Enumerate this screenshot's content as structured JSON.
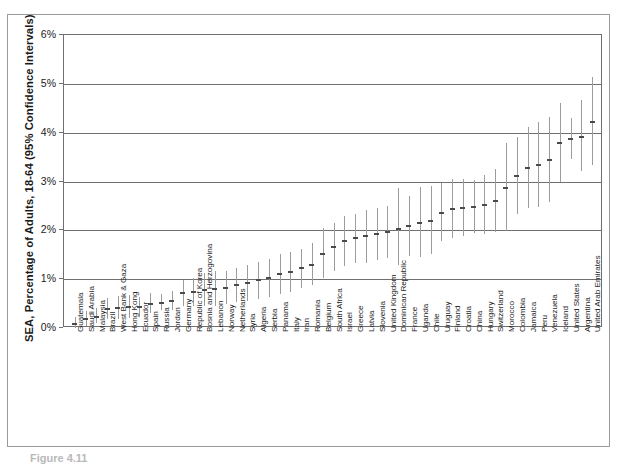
{
  "figure": {
    "caption": "Figure 4.11",
    "y_axis_title": "SEA, Percentage of Adults, 18-64 (95% Confidence Intervals)"
  },
  "chart_data": {
    "type": "scatter",
    "title": "",
    "subtitle": "",
    "xlabel": "",
    "ylabel": "SEA, Percentage of Adults, 18-64 (95% Confidence Intervals)",
    "ylim": [
      0,
      6
    ],
    "y_unit": "percent",
    "y_tick_labels": [
      "0%",
      "1%",
      "2%",
      "3%",
      "4%",
      "5%",
      "6%"
    ],
    "y_ticks": [
      0,
      1,
      2,
      3,
      4,
      5,
      6
    ],
    "grid": "horizontal",
    "legend": "none",
    "error_bars": "95% confidence intervals",
    "marker": "point estimate with vertical CI whisker",
    "sort_order": "ascending by point estimate",
    "n_categories": 63,
    "categories": [
      "Guatemala",
      "Saudi Arabia",
      "Malaysia",
      "Brazil",
      "West Bank & Gaza",
      "Hong Kong",
      "Ecuador",
      "Spain",
      "Russia",
      "Jordan",
      "Germany",
      "Republic of Korea",
      "Bosnia and Herzogovina",
      "Lebanon",
      "Norway",
      "Netherlands",
      "Syria",
      "Algeria",
      "Serbia",
      "Panama",
      "Italy",
      "Iran",
      "Romania",
      "Belgium",
      "South Africa",
      "Israel",
      "Greece",
      "Latvia",
      "Slovenia",
      "United Kingdom",
      "Dominican Republic",
      "France",
      "Uganda",
      "Chile",
      "Uruguay",
      "Finland",
      "Croatia",
      "China",
      "Hungary",
      "Switzerland",
      "Morocco",
      "Colombia",
      "Jamaica",
      "Peru",
      "Venezuela",
      "Iceland",
      "United States",
      "Argentina",
      "United Arab Emirates"
    ],
    "series": [
      {
        "name": "SEA prevalence",
        "values": [
          0.08,
          0.18,
          0.23,
          0.38,
          0.4,
          0.42,
          0.42,
          0.5,
          0.52,
          0.55,
          0.72,
          0.74,
          0.78,
          0.8,
          0.82,
          0.88,
          0.92,
          0.98,
          1.02,
          1.1,
          1.15,
          1.22,
          1.3,
          1.52,
          1.65,
          1.78,
          1.84,
          1.88,
          1.92,
          1.96,
          2.02,
          2.08,
          2.16,
          2.2,
          2.36,
          2.44,
          2.46,
          2.48,
          2.52,
          2.6,
          2.86,
          3.12,
          3.28,
          3.34,
          3.44,
          3.78,
          3.88,
          3.92,
          4.22
        ],
        "ci_low": [
          0.0,
          0.05,
          0.1,
          0.18,
          0.18,
          0.2,
          0.22,
          0.3,
          0.36,
          0.36,
          0.46,
          0.46,
          0.46,
          0.46,
          0.5,
          0.54,
          0.56,
          0.6,
          0.64,
          0.7,
          0.74,
          0.82,
          0.88,
          1.02,
          1.16,
          1.26,
          1.34,
          1.34,
          1.4,
          1.44,
          1.3,
          1.48,
          1.46,
          1.52,
          1.78,
          1.84,
          1.88,
          1.94,
          1.92,
          1.96,
          1.98,
          2.34,
          2.46,
          2.48,
          2.58,
          2.98,
          3.46,
          3.22,
          3.34
        ],
        "ci_high": [
          0.22,
          0.34,
          0.4,
          0.62,
          0.66,
          0.68,
          0.64,
          0.72,
          0.7,
          0.76,
          0.98,
          1.02,
          1.12,
          1.16,
          1.16,
          1.22,
          1.28,
          1.36,
          1.42,
          1.52,
          1.56,
          1.62,
          1.74,
          2.04,
          2.14,
          2.3,
          2.34,
          2.42,
          2.46,
          2.5,
          2.86,
          2.7,
          2.88,
          2.9,
          2.96,
          3.06,
          3.06,
          3.04,
          3.14,
          3.26,
          3.78,
          3.92,
          4.12,
          4.22,
          4.32,
          4.6,
          4.3,
          4.66,
          5.14
        ]
      }
    ]
  }
}
